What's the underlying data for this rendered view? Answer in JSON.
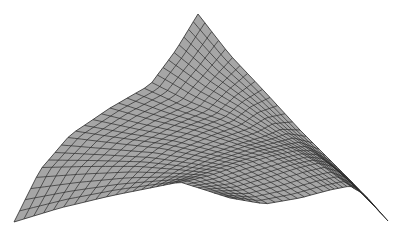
{
  "figure": {
    "title": "3D wireframe surface mesh",
    "fill_color": "#a6a6a6",
    "line_color": "#2b2b2b",
    "background": "#ffffff",
    "grid": {
      "u_lines": 28,
      "v_lines": 28
    },
    "corners": {
      "top_peak": [
        198,
        14
      ],
      "left_tip": [
        14,
        222
      ],
      "right_tip": [
        388,
        221
      ],
      "front_bottom": [
        230,
        198
      ]
    },
    "edges": {
      "top_left": [
        [
          198,
          14
        ],
        [
          176,
          50
        ],
        [
          150,
          85
        ],
        [
          110,
          108
        ],
        [
          70,
          135
        ],
        [
          40,
          170
        ],
        [
          14,
          222
        ]
      ],
      "top_right": [
        [
          198,
          14
        ],
        [
          230,
          55
        ],
        [
          265,
          92
        ],
        [
          300,
          130
        ],
        [
          330,
          160
        ],
        [
          355,
          185
        ],
        [
          388,
          221
        ]
      ],
      "bottom_left": [
        [
          14,
          222
        ],
        [
          60,
          208
        ],
        [
          110,
          196
        ],
        [
          150,
          188
        ],
        [
          180,
          182
        ],
        [
          205,
          190
        ],
        [
          230,
          198
        ]
      ],
      "bottom_right": [
        [
          230,
          198
        ],
        [
          265,
          204
        ],
        [
          300,
          198
        ],
        [
          330,
          190
        ],
        [
          350,
          186
        ],
        [
          365,
          195
        ],
        [
          388,
          221
        ]
      ]
    }
  }
}
